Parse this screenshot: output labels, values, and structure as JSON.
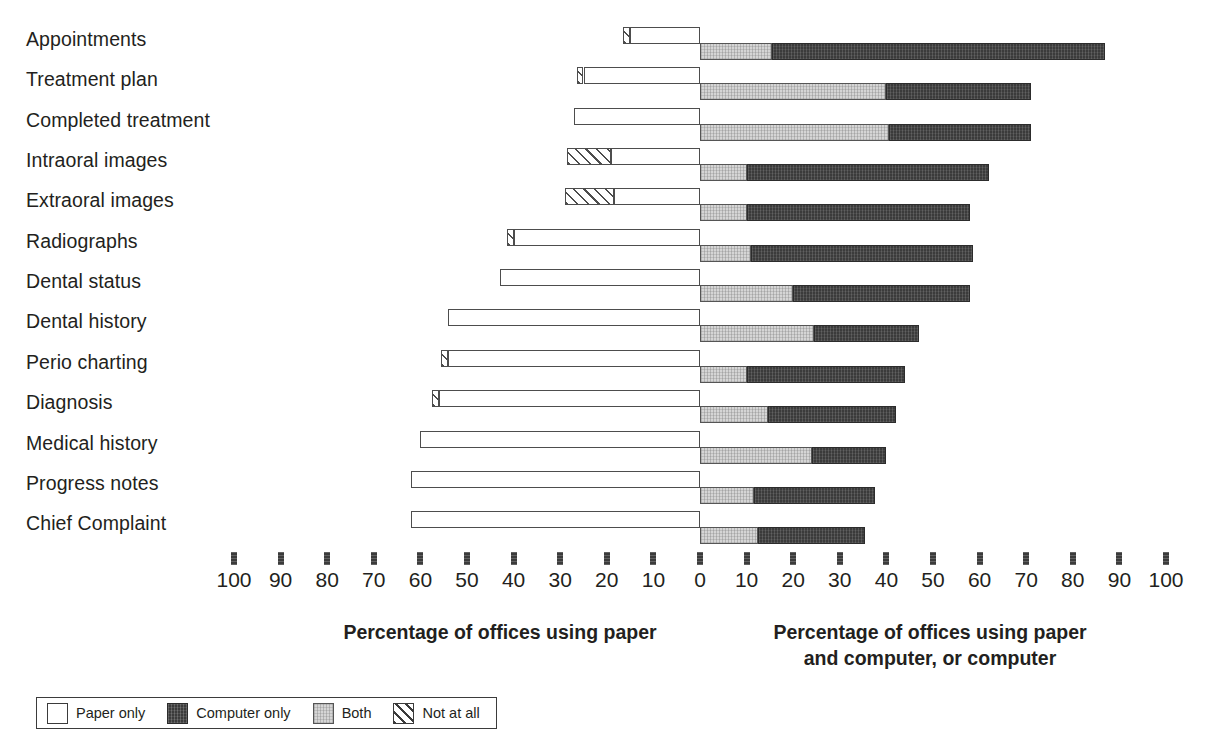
{
  "chart_data": {
    "type": "bar",
    "subtype": "diverging-stacked-horizontal",
    "title": "",
    "xlabel_left": "Percentage of offices using paper",
    "xlabel_right": "Percentage of offices using paper and computer, or computer",
    "ylabel": "",
    "grid": false,
    "legend_position": "bottom-left",
    "axis": {
      "left_ticks": [
        100,
        90,
        80,
        70,
        60,
        50,
        40,
        30,
        20,
        10
      ],
      "center_tick": 0,
      "right_ticks": [
        10,
        20,
        30,
        40,
        50,
        60,
        70,
        80,
        90,
        100
      ],
      "left_max": 100,
      "right_max": 100,
      "units": "percent"
    },
    "categories": [
      "Appointments",
      "Treatment plan",
      "Completed treatment",
      "Intraoral images",
      "Extraoral images",
      "Radiographs",
      "Dental status",
      "Dental history",
      "Perio charting",
      "Diagnosis",
      "Medical history",
      "Progress notes",
      "Chief Complaint"
    ],
    "series": [
      {
        "name": "Not at all",
        "side": "left",
        "values": [
          1.5,
          1.5,
          0,
          9.5,
          10.5,
          1.5,
          0,
          0,
          1.5,
          1.5,
          0,
          0,
          0
        ]
      },
      {
        "name": "Paper only",
        "side": "left",
        "values": [
          15,
          25,
          27,
          19,
          18.5,
          40,
          43,
          54,
          54,
          56,
          60,
          62,
          62
        ]
      },
      {
        "name": "Both",
        "side": "right",
        "values": [
          15.5,
          40,
          40.5,
          10,
          10,
          11,
          20,
          24.5,
          10,
          14.5,
          24,
          11.5,
          12.5
        ]
      },
      {
        "name": "Computer only",
        "side": "right",
        "values": [
          71.5,
          31,
          30.5,
          52,
          48,
          47.5,
          38,
          22.5,
          34,
          27.5,
          16,
          26,
          23
        ]
      }
    ],
    "stacked_totals": {
      "left_total": [
        16.5,
        26.5,
        27,
        28.5,
        29,
        41.5,
        43,
        54,
        55.5,
        57.5,
        60,
        62,
        62
      ],
      "right_total": [
        87,
        71,
        71,
        62,
        58,
        58.5,
        58,
        47,
        44,
        42,
        40,
        37.5,
        35.5
      ]
    }
  },
  "colors": {
    "paper_only": "#ffffff",
    "computer_only": "#3b3b3b",
    "both": "#d5d5d5",
    "not_at_all": "#ffffff",
    "outline": "#3b3b3b",
    "text": "#231f20",
    "background": "#ffffff"
  },
  "axis": {
    "tick_labels": [
      "100",
      "90",
      "80",
      "70",
      "60",
      "50",
      "40",
      "30",
      "20",
      "10",
      "0",
      "10",
      "20",
      "30",
      "40",
      "50",
      "60",
      "70",
      "80",
      "90",
      "100"
    ],
    "title_left": "Percentage of offices using paper",
    "title_right_line1": "Percentage of offices using paper",
    "title_right_line2": "and computer, or computer"
  },
  "legend": {
    "items": [
      {
        "label": "Paper only",
        "swatch": "paper-swatch"
      },
      {
        "label": "Computer only",
        "swatch": "computer-swatch"
      },
      {
        "label": "Both",
        "swatch": "both-swatch"
      },
      {
        "label": "Not at all",
        "swatch": "not-at-all-swatch"
      }
    ]
  }
}
